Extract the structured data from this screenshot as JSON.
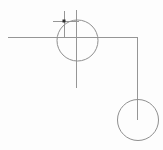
{
  "canvas": {
    "width": 163,
    "height": 150,
    "background_color": "#fdfdfd",
    "line_color": "#969696",
    "circle_color": "#8f8f8f",
    "marker_color": "#2e2e2e",
    "stroke_width": 1
  },
  "drawing": {
    "description": "Schematic line drawing: upper circle crossed by horizontal and vertical construction lines with a small tick cross and dark intersection dot; an L-shaped line runs right then down, ending at the center of a lower-right circle.",
    "lines": [
      {
        "name": "main-horizontal-line",
        "x1": 8,
        "y1": 37,
        "x2": 137,
        "y2": 37
      },
      {
        "name": "upper-vertical-line",
        "x1": 76,
        "y1": 10,
        "x2": 76,
        "y2": 88
      },
      {
        "name": "right-vertical-line",
        "x1": 137,
        "y1": 37,
        "x2": 137,
        "y2": 120
      },
      {
        "name": "tick-horizontal-line",
        "x1": 53,
        "y1": 21,
        "x2": 79,
        "y2": 21
      },
      {
        "name": "tick-vertical-line",
        "x1": 64,
        "y1": 11,
        "x2": 64,
        "y2": 37
      }
    ],
    "circles": [
      {
        "name": "upper-circle",
        "cx": 77.5,
        "cy": 40.5,
        "r": 20.5
      },
      {
        "name": "lower-right-circle",
        "cx": 138,
        "cy": 120,
        "r": 20.5
      }
    ],
    "markers": [
      {
        "name": "intersection-dot",
        "x": 64,
        "y": 21,
        "size": 3
      }
    ]
  }
}
